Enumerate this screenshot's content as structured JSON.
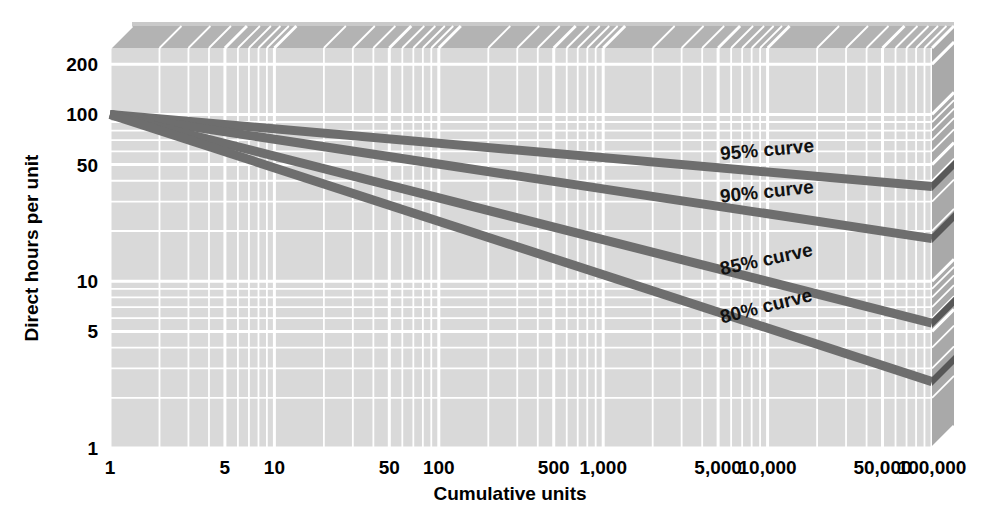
{
  "chart_data": {
    "type": "line",
    "title": "",
    "xlabel": "Cumulative units",
    "ylabel": "Direct hours per unit",
    "xscale": "log",
    "yscale": "log",
    "xlim": [
      1,
      100000
    ],
    "ylim": [
      1,
      250
    ],
    "grid": true,
    "legend_position": "inline-end-of-line",
    "style_note": "3D extruded panel, light gray plot face with white log gridlines, dark gray lines",
    "xticks": [
      1,
      5,
      10,
      50,
      100,
      500,
      1000,
      5000,
      10000,
      50000,
      100000
    ],
    "xticklabels": [
      "1",
      "5",
      "10",
      "50",
      "100",
      "500",
      "1,000",
      "5,000",
      "10,000",
      "50,000",
      "100,000"
    ],
    "yticks": [
      1,
      5,
      10,
      50,
      100,
      200
    ],
    "yticklabels": [
      "1",
      "5",
      "10",
      "50",
      "100",
      "200"
    ],
    "series": [
      {
        "name": "95% curve",
        "label": "95% curve",
        "learning_rate": 0.95,
        "color": "#6e6e6e",
        "x": [
          1,
          100000
        ],
        "y": [
          100,
          37.0
        ],
        "label_rotation_deg": -5
      },
      {
        "name": "90% curve",
        "label": "90% curve",
        "learning_rate": 0.9,
        "color": "#6e6e6e",
        "x": [
          1,
          100000
        ],
        "y": [
          100,
          18.0
        ],
        "label_rotation_deg": -6
      },
      {
        "name": "85% curve",
        "label": "85% curve",
        "learning_rate": 0.85,
        "color": "#6e6e6e",
        "x": [
          1,
          100000
        ],
        "y": [
          100,
          5.6
        ],
        "label_rotation_deg": -12
      },
      {
        "name": "80% curve",
        "label": "80% curve",
        "learning_rate": 0.8,
        "color": "#6e6e6e",
        "x": [
          1,
          100000
        ],
        "y": [
          100,
          2.5
        ],
        "label_rotation_deg": -14
      }
    ],
    "colors": {
      "plot_face": "#d9d9d9",
      "gridline": "#ffffff",
      "curve": "#6e6e6e",
      "top_face": "#b4b4b4",
      "side_face": "#a8a8a8",
      "edge_dark": "#8a8a8a",
      "background": "#ffffff",
      "text": "#000000"
    }
  },
  "axes": {
    "y_title": "Direct hours per unit",
    "x_title": "Cumulative units",
    "y_labels": [
      "200",
      "100",
      "50",
      "10",
      "5",
      "1"
    ],
    "x_labels": [
      "1",
      "5",
      "10",
      "50",
      "100",
      "500",
      "1,000",
      "5,000",
      "10,000",
      "50,000",
      "100,000"
    ]
  },
  "curve_labels": [
    "95% curve",
    "90% curve",
    "85% curve",
    "80% curve"
  ]
}
